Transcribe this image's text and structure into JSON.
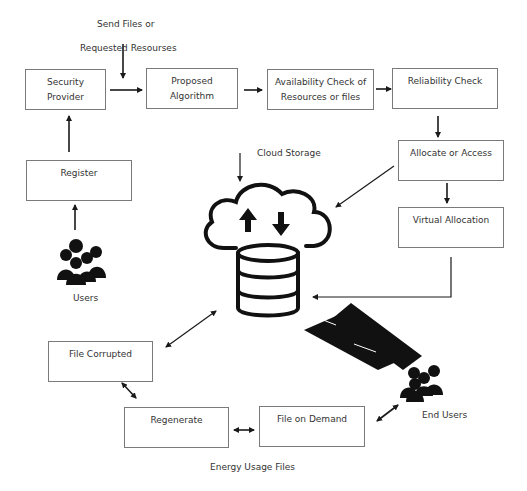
{
  "diagram": {
    "top_label": {
      "line1": "Send Files or",
      "line2": "Requested Resourses"
    },
    "boxes": {
      "security_provider": {
        "line1": "Security",
        "line2": "Provider"
      },
      "proposed_algorithm": {
        "line1": "Proposed",
        "line2": "Algorithm"
      },
      "availability_check": {
        "line1": "Availability Check of",
        "line2": "Resources or files"
      },
      "reliability_check": {
        "line1": "Reliability Check"
      },
      "allocate_or_access": {
        "line1": "Allocate or Access"
      },
      "virtual_allocation": {
        "line1": "Virtual Allocation"
      },
      "register": {
        "line1": "Register"
      },
      "file_corrupted": {
        "line1": "File Corrupted"
      },
      "regenerate": {
        "line1": "Regenerate"
      },
      "file_on_demand": {
        "line1": "File on Demand"
      }
    },
    "labels": {
      "cloud_storage": "Cloud Storage",
      "users": "Users",
      "end_users": "End Users",
      "energy_usage_files": "Energy Usage Files"
    },
    "colors": {
      "stroke": "#1a1a1a",
      "box_border": "#7a7a7a",
      "icon_fill": "#111111"
    }
  }
}
